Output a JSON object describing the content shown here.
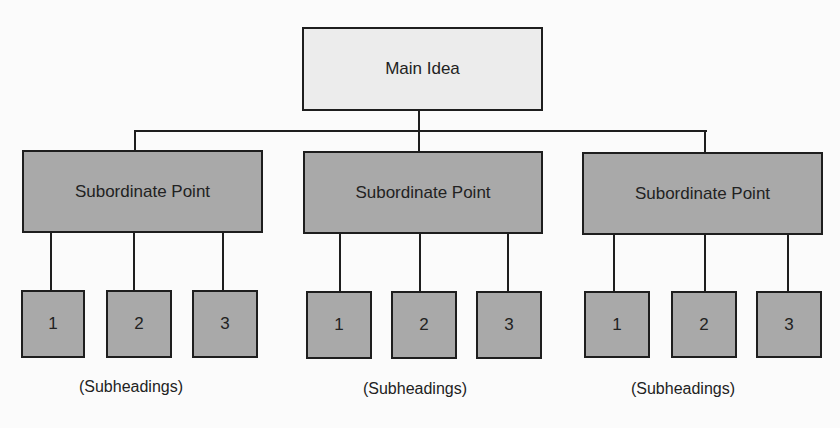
{
  "diagram": {
    "type": "hierarchy",
    "root": {
      "label": "Main Idea",
      "fill": "#ececec"
    },
    "branches": [
      {
        "label": "Subordinate Point",
        "children": [
          "1",
          "2",
          "3"
        ],
        "caption": "(Subheadings)"
      },
      {
        "label": "Subordinate Point",
        "children": [
          "1",
          "2",
          "3"
        ],
        "caption": "(Subheadings)"
      },
      {
        "label": "Subordinate Point",
        "children": [
          "1",
          "2",
          "3"
        ],
        "caption": "(Subheadings)"
      }
    ],
    "colors": {
      "branch_fill": "#a9a9a9",
      "stroke": "#1e1e1e",
      "background": "#fbfbfb"
    }
  }
}
